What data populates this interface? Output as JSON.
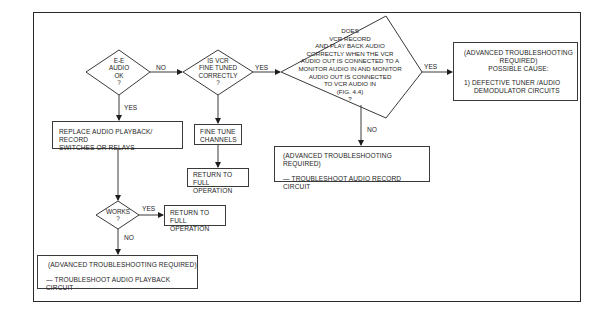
{
  "flowchart": {
    "decision_ee_audio": {
      "lines": [
        "E-E",
        "AUDIO",
        "OK",
        "?"
      ]
    },
    "decision_fine_tuned": {
      "lines": [
        "IS VCR",
        "FINE TUNED",
        "CORRECTLY",
        "?"
      ]
    },
    "decision_monitor_test": {
      "lines": [
        "DOES",
        "VCR RECORD",
        "AND PLAY BACK AUDIO",
        "CORRECTLY WHEN THE VCR",
        "AUDIO OUT IS CONNECTED TO A",
        "MONITOR AUDIO IN AND MONITOR",
        "AUDIO OUT IS CONNECTED",
        "TO VCR AUDIO IN",
        "(FIG. 4.4)",
        "?"
      ]
    },
    "decision_works": {
      "lines": [
        "WORKS",
        "?"
      ]
    },
    "box_possible_cause": {
      "line1": "(ADVANCED TROUBLESHOOTING",
      "line2": "REQUIRED)",
      "line3": "POSSIBLE CAUSE:",
      "item1": "1)  DEFECTIVE TUNER /AUDIO",
      "item1b": "DEMODULATOR CIRCUITS"
    },
    "box_replace": {
      "line1": "REPLACE AUDIO PLAYBACK/ RECORD",
      "line2": "SWITCHES OR RELAYS"
    },
    "box_fine_tune": {
      "line1": "FINE TUNE",
      "line2": "CHANNELS"
    },
    "box_return_1": {
      "line1": "RETURN TO FULL",
      "line2": "OPERATION"
    },
    "box_return_2": {
      "line1": "RETURN TO FULL",
      "line2": "OPERATION"
    },
    "box_record_circuit": {
      "line1": "(ADVANCED TROUBLESHOOTING REQUIRED)",
      "line2": "—  TROUBLESHOOT AUDIO RECORD CIRCUIT"
    },
    "box_playback_circuit": {
      "line1": "(ADVANCED TROUBLESHOOTING REQUIRED)",
      "line2": "—  TROUBLESHOOT AUDIO PLAYBACK CIRCUIT"
    },
    "edge_labels": {
      "ee_no": "NO",
      "ee_yes": "YES",
      "tuned_yes": "YES",
      "monitor_yes": "YES",
      "monitor_no": "NO",
      "works_yes": "YES",
      "works_no": "NO"
    }
  }
}
